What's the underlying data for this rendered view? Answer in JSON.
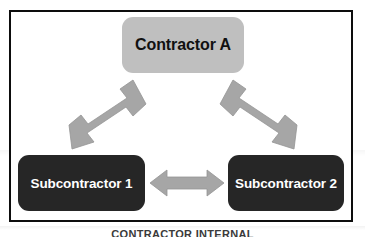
{
  "diagram": {
    "caption": "CONTRACTOR INTERNAL",
    "colors": {
      "frame_border": "#0d0d0d",
      "background": "#ffffff",
      "top_node_fill": "#bfbfbf",
      "top_node_text": "#111111",
      "sub_node_fill": "#262626",
      "sub_node_text": "#ffffff",
      "arrow_fill": "#a6a6a6",
      "arrow_stroke": "#8c8c8c"
    },
    "nodes": [
      {
        "id": "contractor-a",
        "label": "Contractor A"
      },
      {
        "id": "subcontractor-1",
        "label": "Subcontractor 1"
      },
      {
        "id": "subcontractor-2",
        "label": "Subcontractor 2"
      }
    ],
    "connections": [
      {
        "id": "a-to-sub1",
        "from": "contractor-a",
        "to": "subcontractor-1",
        "style": "double-headed-arrow",
        "orientation": "diagonal"
      },
      {
        "id": "a-to-sub2",
        "from": "contractor-a",
        "to": "subcontractor-2",
        "style": "double-headed-arrow",
        "orientation": "diagonal"
      },
      {
        "id": "sub1-to-sub2",
        "from": "subcontractor-1",
        "to": "subcontractor-2",
        "style": "double-headed-arrow",
        "orientation": "horizontal"
      }
    ]
  }
}
